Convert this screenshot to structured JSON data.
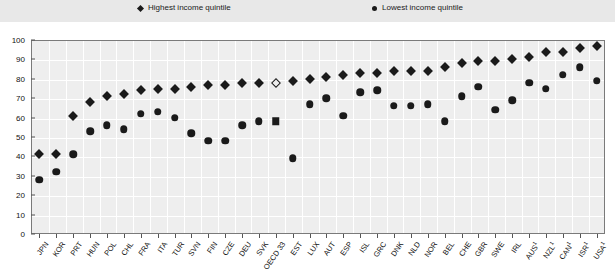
{
  "legend": {
    "high_label": "Highest income quintile",
    "high_marker": "diamond-icon",
    "low_label": "Lowest income quintile",
    "low_marker": "circle-icon"
  },
  "axis": {
    "y_ticks": [
      "0",
      "10",
      "20",
      "30",
      "40",
      "50",
      "60",
      "70",
      "80",
      "90",
      "100"
    ],
    "y_min": 0,
    "y_max": 100,
    "y_step": 10
  },
  "chart_data": {
    "type": "scatter",
    "title": "",
    "subtitle": "",
    "xlabel": "",
    "ylabel": "",
    "ylim": [
      0,
      100
    ],
    "grid": true,
    "legend_position": "top",
    "categories": [
      "JPN",
      "KOR",
      "PRT",
      "HUN",
      "POL",
      "CHL",
      "FRA",
      "ITA",
      "TUR",
      "SVN",
      "FIN",
      "CZE",
      "DEU",
      "SVK",
      "OECD 33",
      "EST",
      "LUX",
      "AUT",
      "ESP",
      "ISL",
      "GRC",
      "DNK",
      "NLD",
      "NOR",
      "BEL",
      "CHE",
      "GBR",
      "SWE",
      "IRL",
      "AUS1",
      "NZL1",
      "CAN1",
      "ISR1",
      "USA1"
    ],
    "series": [
      {
        "name": "Highest income quintile",
        "marker": "diamond",
        "values": [
          41,
          41,
          61,
          68,
          71,
          72,
          74,
          75,
          75,
          76,
          77,
          77,
          78,
          78,
          78,
          79,
          80,
          81,
          82,
          83,
          83,
          84,
          84,
          84,
          86,
          88,
          89,
          89,
          90,
          91,
          94,
          94,
          96,
          97
        ]
      },
      {
        "name": "Lowest income quintile",
        "marker": "circle",
        "values": [
          28,
          32,
          41,
          53,
          56,
          54,
          62,
          63,
          60,
          52,
          48,
          48,
          56,
          58,
          58,
          39,
          67,
          70,
          61,
          73,
          74,
          66,
          66,
          67,
          58,
          71,
          76,
          64,
          69,
          78,
          75,
          82,
          86,
          79
        ]
      }
    ],
    "special_markers": [
      {
        "category": "OECD 33",
        "series": "Highest income quintile",
        "marker": "diamond-open"
      },
      {
        "category": "OECD 33",
        "series": "Lowest income quintile",
        "marker": "square"
      }
    ]
  }
}
